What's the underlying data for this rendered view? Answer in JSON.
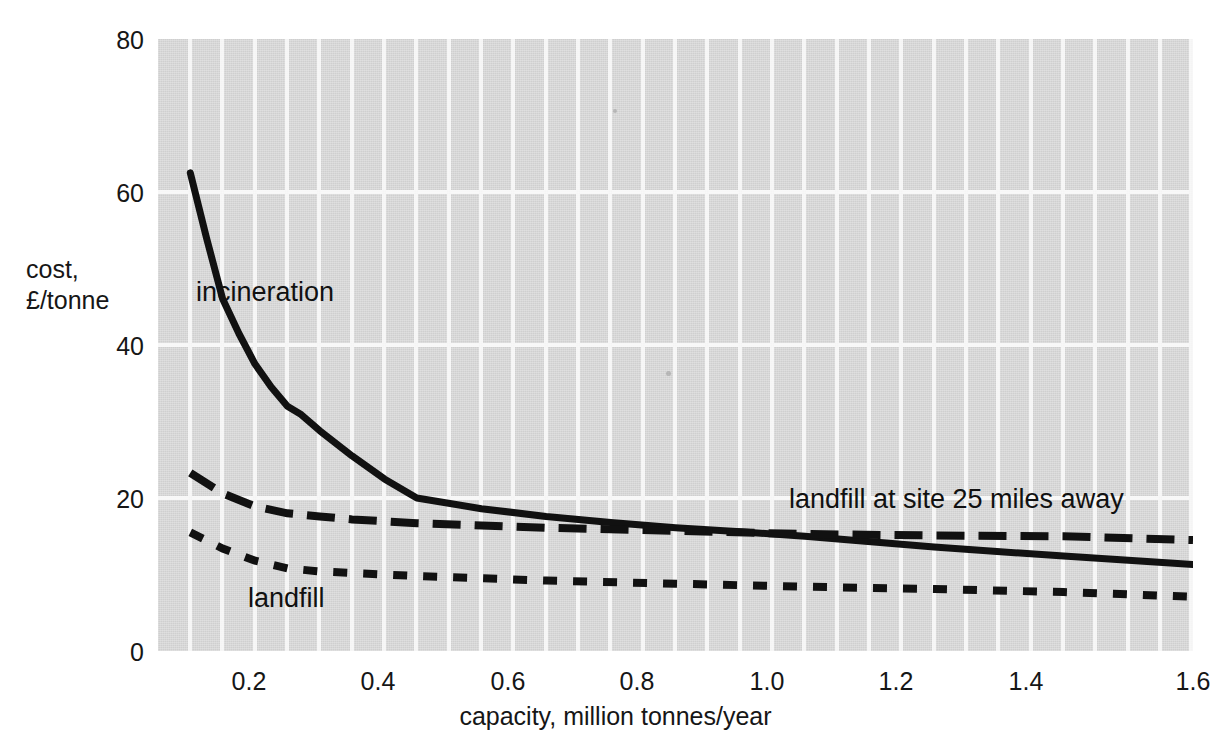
{
  "chart_data": {
    "type": "line",
    "title": "",
    "xlabel": "capacity, million tonnes/year",
    "ylabel": "cost,\n£/tonne",
    "ylabel_line1": "cost,",
    "ylabel_line2": "£/tonne",
    "xlim": [
      0.0,
      1.6
    ],
    "ylim": [
      0,
      80
    ],
    "xticks": [
      "0.2",
      "0.4",
      "0.6",
      "0.8",
      "1.0",
      "1.2",
      "1.4",
      "1.6"
    ],
    "xtick_values": [
      0.2,
      0.4,
      0.6,
      0.8,
      1.0,
      1.2,
      1.4,
      1.6
    ],
    "yticks": [
      "0",
      "20",
      "40",
      "60",
      "80"
    ],
    "ytick_values": [
      0,
      20,
      40,
      60,
      80
    ],
    "grid": true,
    "grid_color": "#f4f4f4",
    "plot_background": "#cfcfcf",
    "legend_position": "inline-annotations",
    "series": [
      {
        "name": "incineration",
        "style": "solid",
        "color": "#111111",
        "x": [
          0.05,
          0.075,
          0.1,
          0.125,
          0.15,
          0.175,
          0.2,
          0.22,
          0.25,
          0.3,
          0.35,
          0.4,
          0.5,
          0.6,
          0.7,
          0.8,
          0.9,
          1.0,
          1.2,
          1.4,
          1.6
        ],
        "y": [
          62.5,
          54.0,
          46.0,
          41.5,
          37.5,
          34.5,
          32.0,
          31.0,
          28.8,
          25.5,
          22.5,
          20.0,
          18.6,
          17.6,
          16.8,
          16.1,
          15.6,
          15.0,
          13.6,
          12.4,
          11.3
        ]
      },
      {
        "name": "landfill at site 25 miles away",
        "style": "long-dash",
        "color": "#111111",
        "x": [
          0.05,
          0.1,
          0.15,
          0.2,
          0.25,
          0.3,
          0.4,
          0.5,
          0.6,
          0.8,
          1.0,
          1.2,
          1.4,
          1.6
        ],
        "y": [
          23.3,
          20.6,
          18.9,
          18.0,
          17.6,
          17.2,
          16.7,
          16.4,
          16.1,
          15.7,
          15.3,
          15.1,
          15.0,
          14.5
        ]
      },
      {
        "name": "landfill",
        "style": "short-dash",
        "color": "#111111",
        "x": [
          0.05,
          0.1,
          0.15,
          0.2,
          0.25,
          0.3,
          0.4,
          0.5,
          0.6,
          0.8,
          1.0,
          1.2,
          1.4,
          1.6
        ],
        "y": [
          15.5,
          13.4,
          11.8,
          10.8,
          10.4,
          10.2,
          9.8,
          9.5,
          9.2,
          8.8,
          8.4,
          8.1,
          7.7,
          7.1
        ]
      }
    ],
    "annotations": [
      {
        "text": "incineration",
        "x": 0.11,
        "y": 46.5
      },
      {
        "text": "landfill at site 25 miles away",
        "x": 0.98,
        "y": 21.5
      },
      {
        "text": "landfill",
        "x": 0.19,
        "y": 8.3
      }
    ]
  }
}
